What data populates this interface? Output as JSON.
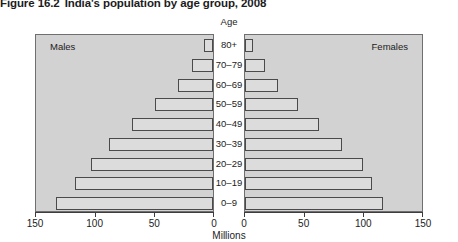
{
  "figure": {
    "number": "Figure 16.2",
    "title": "India's population by age group, 2008"
  },
  "chart_data": {
    "type": "bar",
    "subtype": "population-pyramid",
    "title": "India's population by age group, 2008",
    "xlabel": "Millions",
    "ylabel": "Age",
    "categories": [
      "80+",
      "70–79",
      "60–69",
      "50–59",
      "40–49",
      "30–39",
      "20–29",
      "10–19",
      "0–9"
    ],
    "series": [
      {
        "name": "Males",
        "side": "left",
        "values": [
          8,
          18,
          30,
          49,
          69,
          88,
          103,
          117,
          133
        ]
      },
      {
        "name": "Females",
        "side": "right",
        "values": [
          7,
          17,
          28,
          45,
          63,
          82,
          100,
          108,
          117
        ]
      }
    ],
    "xlim": [
      0,
      150
    ],
    "xticks": [
      0,
      50,
      100,
      150
    ],
    "left_tick_labels": [
      "150",
      "100",
      "50",
      "0"
    ],
    "right_tick_labels": [
      "0",
      "50",
      "100",
      "150"
    ],
    "grid": false,
    "legend": "in-panel-corners",
    "bar_fill": "#dcdcdc",
    "bar_stroke": "#4a4a4a",
    "plot_background": "#d2d2d2"
  },
  "labels": {
    "males": "Males",
    "females": "Females",
    "age_heading": "Age",
    "millions": "Millions"
  }
}
